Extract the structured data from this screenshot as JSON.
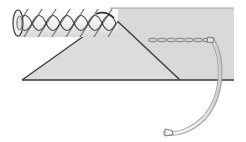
{
  "figure": {
    "canvas": {
      "width": 246,
      "height": 142,
      "background": "#ffffff"
    },
    "colors": {
      "band_fill": "#d9d9d9",
      "triangle_fill": "#dcdcdc",
      "outline_dark": "#3a3a3a",
      "outline_mid": "#6e6e6e",
      "outline_light": "#9a9a9a",
      "rope_fill": "#f2f2f2",
      "needle_fill": "#fafafa",
      "thread_fill": "#ededed",
      "white": "#ffffff"
    },
    "band": {
      "label": "shaded background band",
      "x": 110,
      "y": 8,
      "width": 124,
      "height": 72,
      "baseline_y": 80
    },
    "triangle": {
      "label": "shaded triangular wedge",
      "apex_x": 112,
      "apex_y": 16,
      "left_x": 22,
      "right_x": 180,
      "base_y": 80
    },
    "rope": {
      "label": "twisted three-strand rope",
      "start_x": 14,
      "end_x": 118,
      "center_y": 23,
      "radius": 14,
      "strand_count": 7,
      "cap_label": "cut rope end"
    },
    "thread": {
      "label": "braided suture thread",
      "start_x": 148,
      "end_x": 210,
      "y": 40,
      "link_count": 7
    },
    "needle": {
      "label": "curved surgical needle",
      "swage_x": 210,
      "swage_y": 40,
      "tip_x": 164,
      "tip_y": 131,
      "arc_radius": 52
    }
  }
}
